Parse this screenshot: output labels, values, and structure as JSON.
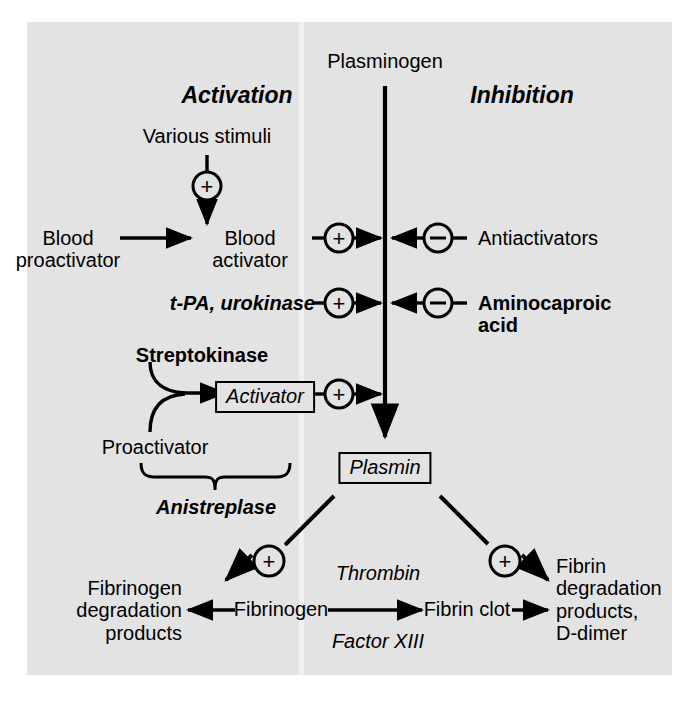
{
  "diagram": {
    "background_color": "#e3e3e3",
    "line_color": "#000000",
    "columns": {
      "activation_header": "Activation",
      "inhibition_header": "Inhibition"
    },
    "nodes": {
      "plasminogen": "Plasminogen",
      "various_stimuli": "Various stimuli",
      "blood_proactivator": "Blood\nproactivator",
      "blood_activator": "Blood\nactivator",
      "tpa_urokinase": "t-PA, urokinase",
      "antiactivators": "Antiactivators",
      "aminocaproic_acid": "Aminocaproic\nacid",
      "streptokinase": "Streptokinase",
      "proactivator": "Proactivator",
      "activator_box": "Activator",
      "anistreplase": "Anistreplase",
      "plasmin_box": "Plasmin",
      "fibrinogen": "Fibrinogen",
      "fibrin_clot": "Fibrin clot",
      "thrombin": "Thrombin",
      "factor_xiii": "Factor XIII",
      "fibrinogen_degradation_products": "Fibrinogen\ndegradation\nproducts",
      "fibrin_degradation_products": "Fibrin\ndegradation\nproducts,\nD-dimer"
    },
    "signs": {
      "plus": "+",
      "minus": "−"
    },
    "edge_signs": [
      {
        "name": "stimuli-to-blood-activator",
        "sign": "+"
      },
      {
        "name": "blood-activator-to-plasminogen",
        "sign": "+"
      },
      {
        "name": "tpa-urokinase-to-plasminogen",
        "sign": "+"
      },
      {
        "name": "activator-to-plasminogen",
        "sign": "+"
      },
      {
        "name": "antiactivators-to-plasminogen",
        "sign": "−"
      },
      {
        "name": "aminocaproic-acid-to-plasminogen",
        "sign": "−"
      },
      {
        "name": "plasmin-to-fibrinogen",
        "sign": "+"
      },
      {
        "name": "plasmin-to-fibrin-clot",
        "sign": "+"
      }
    ]
  }
}
